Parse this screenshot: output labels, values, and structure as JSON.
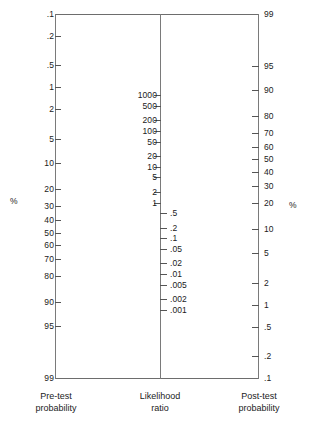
{
  "figure": {
    "name": "fagan-nomogram",
    "line_color": "#7a7a7a",
    "text_color": "#1b1b1b",
    "background": "#ffffff"
  },
  "axes": {
    "pretest": {
      "caption": "Pre-test\nprobability",
      "unit_label": "%",
      "direction": "increasing-downward",
      "top_value": ".1",
      "bottom_value": "99",
      "ticks": [
        {
          "label": ".1",
          "value": 0.1
        },
        {
          "label": ".2",
          "value": 0.2
        },
        {
          "label": ".5",
          "value": 0.5
        },
        {
          "label": "1",
          "value": 1
        },
        {
          "label": "2",
          "value": 2
        },
        {
          "label": "5",
          "value": 5
        },
        {
          "label": "10",
          "value": 10
        },
        {
          "label": "20",
          "value": 20
        },
        {
          "label": "30",
          "value": 30
        },
        {
          "label": "40",
          "value": 40
        },
        {
          "label": "50",
          "value": 50
        },
        {
          "label": "60",
          "value": 60
        },
        {
          "label": "70",
          "value": 70
        },
        {
          "label": "80",
          "value": 80
        },
        {
          "label": "90",
          "value": 90
        },
        {
          "label": "95",
          "value": 95
        },
        {
          "label": "99",
          "value": 99
        }
      ]
    },
    "likelihood_ratio": {
      "caption": "Likelihood\nratio",
      "labels_side_high": "left",
      "labels_side_low": "right",
      "ticks_high": [
        {
          "label": "1000",
          "value": 1000
        },
        {
          "label": "500",
          "value": 500
        },
        {
          "label": "200",
          "value": 200
        },
        {
          "label": "100",
          "value": 100
        },
        {
          "label": "50",
          "value": 50
        },
        {
          "label": "20",
          "value": 20
        },
        {
          "label": "10",
          "value": 10
        },
        {
          "label": "5",
          "value": 5
        },
        {
          "label": "2",
          "value": 2
        },
        {
          "label": "1",
          "value": 1
        }
      ],
      "ticks_low": [
        {
          "label": ".5",
          "value": 0.5
        },
        {
          "label": ".2",
          "value": 0.2
        },
        {
          "label": ".1",
          "value": 0.1
        },
        {
          "label": ".05",
          "value": 0.05
        },
        {
          "label": ".02",
          "value": 0.02
        },
        {
          "label": ".01",
          "value": 0.01
        },
        {
          "label": ".005",
          "value": 0.005
        },
        {
          "label": ".002",
          "value": 0.002
        },
        {
          "label": ".001",
          "value": 0.001
        }
      ]
    },
    "posttest": {
      "caption": "Post-test\nprobability",
      "unit_label": "%",
      "direction": "decreasing-downward",
      "top_value": "99",
      "bottom_value": ".1",
      "ticks": [
        {
          "label": "99",
          "value": 99
        },
        {
          "label": "95",
          "value": 95
        },
        {
          "label": "90",
          "value": 90
        },
        {
          "label": "80",
          "value": 80
        },
        {
          "label": "70",
          "value": 70
        },
        {
          "label": "60",
          "value": 60
        },
        {
          "label": "50",
          "value": 50
        },
        {
          "label": "40",
          "value": 40
        },
        {
          "label": "30",
          "value": 30
        },
        {
          "label": "20",
          "value": 20
        },
        {
          "label": "10",
          "value": 10
        },
        {
          "label": "5",
          "value": 5
        },
        {
          "label": "2",
          "value": 2
        },
        {
          "label": "1",
          "value": 1
        },
        {
          "label": ".5",
          "value": 0.5
        },
        {
          "label": ".2",
          "value": 0.2
        },
        {
          "label": ".1",
          "value": 0.1
        }
      ]
    }
  },
  "chart_data": {
    "type": "line",
    "xlabel": "",
    "ylabel": "",
    "series": [
      {
        "name": "Pre-test probability (%)",
        "axis": "left",
        "scale": "logit",
        "values": [
          0.1,
          0.2,
          0.5,
          1,
          2,
          5,
          10,
          20,
          30,
          40,
          50,
          60,
          70,
          80,
          90,
          95,
          99
        ],
        "ylim": [
          0.1,
          99
        ]
      },
      {
        "name": "Likelihood ratio",
        "axis": "center",
        "scale": "log-reversed",
        "values": [
          1000,
          500,
          200,
          100,
          50,
          20,
          10,
          5,
          2,
          1,
          0.5,
          0.2,
          0.1,
          0.05,
          0.02,
          0.01,
          0.005,
          0.002,
          0.001
        ],
        "ylim": [
          1000,
          0.001
        ]
      },
      {
        "name": "Post-test probability (%)",
        "axis": "right",
        "scale": "logit-reversed",
        "values": [
          99,
          95,
          90,
          80,
          70,
          60,
          50,
          40,
          30,
          20,
          10,
          5,
          2,
          1,
          0.5,
          0.2,
          0.1
        ],
        "ylim": [
          99,
          0.1
        ]
      }
    ],
    "grid": false,
    "legend": "none"
  }
}
